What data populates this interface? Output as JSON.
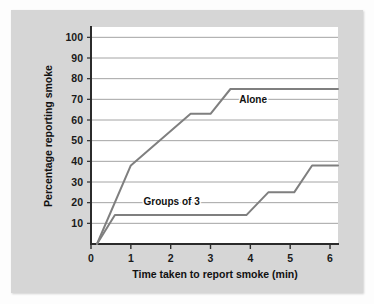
{
  "figure": {
    "background_color": "#d6d6d6",
    "page_color": "#fdfdfd",
    "plot_background_color": "#ffffff"
  },
  "chart_data": {
    "type": "line",
    "title": "",
    "xlabel": "Time taken to report smoke (min)",
    "ylabel": "Percentage reporting smoke",
    "xlim": [
      0,
      6.2
    ],
    "ylim": [
      0,
      105
    ],
    "xticks": [
      0,
      1,
      2,
      3,
      4,
      5,
      6
    ],
    "xtick_labels": [
      "0",
      "1",
      "2",
      "3",
      "4",
      "5",
      "6"
    ],
    "yticks": [
      10,
      20,
      30,
      40,
      50,
      60,
      70,
      80,
      90,
      100
    ],
    "ytick_labels": [
      "10",
      "20",
      "30",
      "40",
      "50",
      "60",
      "70",
      "80",
      "90",
      "100"
    ],
    "grid": "horizontal",
    "grid_color": "#9a9a9a",
    "legend_position": "inline-annotations",
    "line_color": "#7f7f7f",
    "line_width": 2,
    "series": [
      {
        "name": "Alone",
        "label_x": 3.72,
        "label_y": 68,
        "points": [
          {
            "x": 0.15,
            "y": 0
          },
          {
            "x": 1.0,
            "y": 38
          },
          {
            "x": 2.5,
            "y": 63
          },
          {
            "x": 3.0,
            "y": 63
          },
          {
            "x": 3.5,
            "y": 75
          },
          {
            "x": 6.2,
            "y": 75
          }
        ]
      },
      {
        "name": "Groups of 3",
        "label_x": 1.32,
        "label_y": 19,
        "points": [
          {
            "x": 0.15,
            "y": 0
          },
          {
            "x": 0.6,
            "y": 14
          },
          {
            "x": 3.9,
            "y": 14
          },
          {
            "x": 4.45,
            "y": 25
          },
          {
            "x": 5.1,
            "y": 25
          },
          {
            "x": 5.55,
            "y": 38
          },
          {
            "x": 6.2,
            "y": 38
          }
        ]
      }
    ]
  }
}
